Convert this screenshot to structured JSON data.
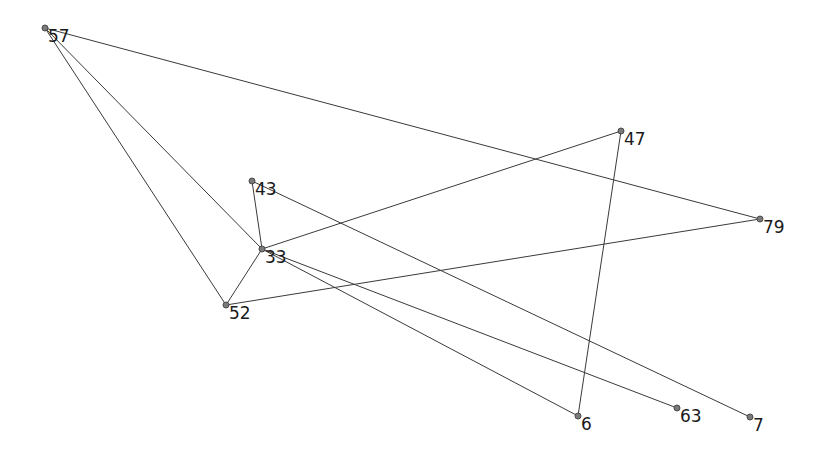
{
  "diagram": {
    "type": "network-graph",
    "colors": {
      "edge": "#3a3a3a",
      "node": "#7a7a7a",
      "label": "#1a1a1a",
      "background": "#ffffff"
    },
    "nodes": [
      {
        "id": "57",
        "label": "57"
      },
      {
        "id": "47",
        "label": "47"
      },
      {
        "id": "43",
        "label": "43"
      },
      {
        "id": "79",
        "label": "79"
      },
      {
        "id": "33",
        "label": "33"
      },
      {
        "id": "52",
        "label": "52"
      },
      {
        "id": "6",
        "label": "6"
      },
      {
        "id": "63",
        "label": "63"
      },
      {
        "id": "7",
        "label": "7"
      }
    ],
    "edges": [
      [
        "57",
        "79"
      ],
      [
        "57",
        "33"
      ],
      [
        "57",
        "52"
      ],
      [
        "43",
        "33"
      ],
      [
        "43",
        "7"
      ],
      [
        "33",
        "47"
      ],
      [
        "33",
        "6"
      ],
      [
        "33",
        "63"
      ],
      [
        "52",
        "33"
      ],
      [
        "52",
        "79"
      ],
      [
        "47",
        "6"
      ]
    ]
  }
}
